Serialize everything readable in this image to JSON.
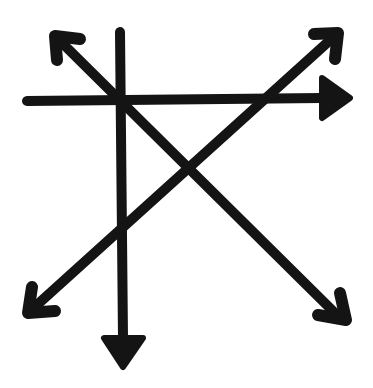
{
  "diagram": {
    "title": "",
    "background": "#ffffff",
    "stroke_color": "#141414",
    "stroke_width": 10,
    "arrows": [
      {
        "name": "horizontal-arrow",
        "direction": "right",
        "head": "filled-triangle",
        "from": [
          27,
          101
        ],
        "to": [
          322,
          98
        ],
        "head_points": "322,78 350,98 322,118"
      },
      {
        "name": "vertical-arrow",
        "direction": "down",
        "head": "filled-triangle",
        "from": [
          120,
          32
        ],
        "to": [
          123,
          338
        ],
        "head_points": "104,338 143,338 123,367"
      },
      {
        "name": "diagonal-nw-arrow",
        "direction": "up-left",
        "head": "open-chevron",
        "from": [
          340,
          318
        ],
        "to": [
          55,
          36
        ],
        "chevron": "57,60 55,36 80,39"
      },
      {
        "name": "diagonal-se-head",
        "direction": "down-right",
        "head": "open-chevron",
        "chevron": "318,315 346,320 340,293"
      },
      {
        "name": "diagonal-ne-arrow",
        "direction": "up-right",
        "head": "open-chevron",
        "from": [
          28,
          313
        ],
        "to": [
          338,
          33
        ],
        "chevron": "314,34 338,33 335,59"
      },
      {
        "name": "diagonal-sw-head",
        "direction": "down-left",
        "head": "open-chevron",
        "chevron": "32,287 28,313 55,311"
      }
    ]
  }
}
